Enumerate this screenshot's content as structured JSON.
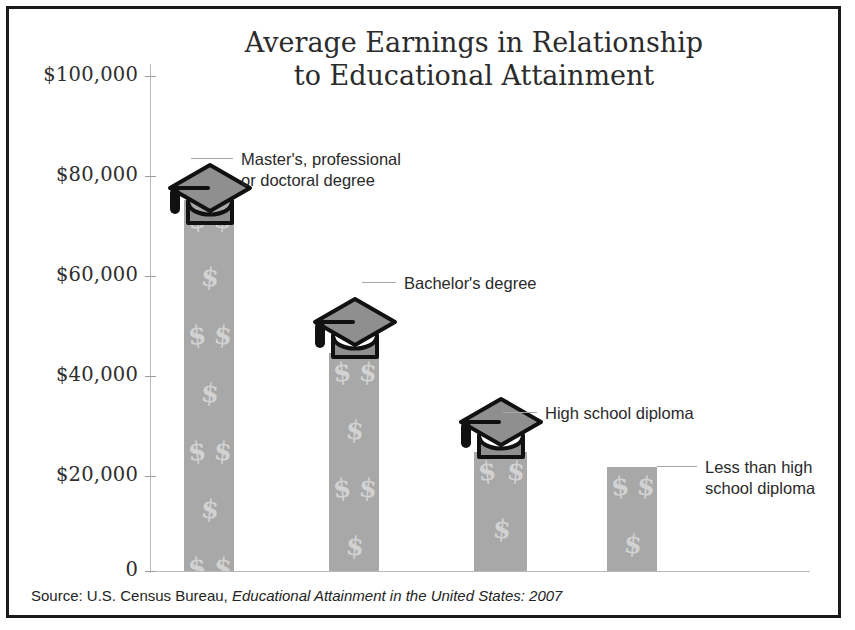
{
  "chart_data": {
    "type": "bar",
    "title": "Average Earnings in Relationship to Educational Attainment",
    "title_lines": [
      "Average Earnings in Relationship",
      "to Educational Attainment"
    ],
    "xlabel": "",
    "ylabel": "",
    "ylim": [
      0,
      100000
    ],
    "grid": false,
    "legend": "none",
    "tick_labels": [
      "$100,000",
      "$80,000",
      "$60,000",
      "$40,000",
      "$20,000",
      "0"
    ],
    "tick_values": [
      100000,
      80000,
      60000,
      40000,
      20000,
      0
    ],
    "categories": [
      "Master's, professional or doctoral degree",
      "Bachelor's degree",
      "High school diploma",
      "Less than high school diploma"
    ],
    "values": [
      75000,
      44000,
      24000,
      21000
    ],
    "bar_fill_color": "#a8a8a8",
    "bar_pattern": "dollar-sign",
    "annotations": [
      {
        "lines": [
          "Master's, professional",
          "or doctoral degree"
        ],
        "marker": "graduation-cap"
      },
      {
        "lines": [
          "Bachelor's degree"
        ],
        "marker": "graduation-cap"
      },
      {
        "lines": [
          "High school diploma"
        ],
        "marker": "graduation-cap"
      },
      {
        "lines": [
          "Less than high",
          "school diploma"
        ],
        "marker": "none"
      }
    ]
  },
  "source": {
    "prefix": "Source: U.S. Census Bureau, ",
    "italic": "Educational Attainment in the United States: 2007"
  },
  "ticks": [
    {
      "label": "$100,000"
    },
    {
      "label": "$80,000"
    },
    {
      "label": "$60,000"
    },
    {
      "label": "$40,000"
    },
    {
      "label": "$20,000"
    },
    {
      "label": "0"
    }
  ],
  "title": {
    "line1": "Average Earnings in Relationship",
    "line2": "to Educational Attainment"
  },
  "callouts": {
    "masters": {
      "line1": "Master's, professional",
      "line2": "or doctoral degree"
    },
    "bachelors": {
      "line1": "Bachelor's degree"
    },
    "highschool": {
      "line1": "High school diploma"
    },
    "lessthan": {
      "line1": "Less than high",
      "line2": "school diploma"
    }
  },
  "money_glyph": "$"
}
